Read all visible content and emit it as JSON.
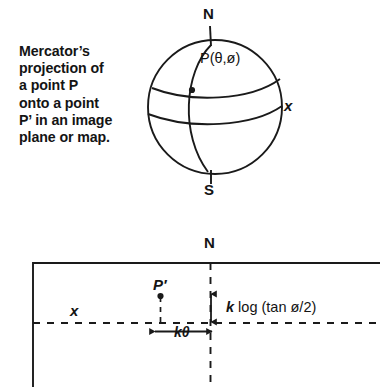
{
  "figure": {
    "caption": "Mercator’s\nprojection of\na point P\nonto a point\nP’ in an image\nplane or map.",
    "caption_lines": [
      "Mercator’s",
      "projection of",
      "a point P",
      "onto a point",
      "P’ in an image",
      "plane or map."
    ],
    "line_color": "#1a1a1a",
    "background_color": "#ffffff"
  },
  "sphere_diagram": {
    "north_pole_label": "N",
    "south_pole_label": "S",
    "point_label": "P(θ,ø)",
    "axis_label_x": "x",
    "circle": {
      "cx": 215,
      "cy": 107,
      "r": 67
    },
    "point_marker": {
      "cx": 192,
      "cy": 90,
      "r": 3
    },
    "meridian": "great-circle-arc-through-poles",
    "latitudes": [
      "upper-parallel",
      "equator"
    ]
  },
  "map_diagram": {
    "north_label": "N",
    "axis_label_x": "x",
    "projected_point_label": "P′",
    "vertical_measure_label": "k log (tan ø/2)",
    "horizontal_measure_label": "kθ",
    "rectangle": {
      "x": 33,
      "y": 263,
      "right": 392,
      "bottom": 399
    },
    "vertical_dashed_line_x": 210,
    "horizontal_dashed_line_y": 323,
    "projected_point_marker": {
      "cx": 160,
      "cy": 297,
      "r": 3
    }
  }
}
